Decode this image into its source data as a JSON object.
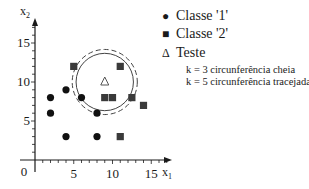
{
  "chart_data": {
    "type": "scatter",
    "title": "",
    "xlabel": "x1",
    "ylabel": "x2",
    "x_ticks": [
      0,
      5,
      10,
      15
    ],
    "y_ticks": [
      5,
      10,
      15
    ],
    "origin_label": "0",
    "xlim": [
      0,
      17
    ],
    "ylim": [
      0,
      17
    ],
    "grid": false,
    "legend_position": "upper right (outside plot)",
    "series": [
      {
        "name": "Classe '1'",
        "marker": "circle",
        "color": "#111111",
        "points": [
          [
            2,
            8
          ],
          [
            2,
            6
          ],
          [
            4,
            9
          ],
          [
            6,
            8
          ],
          [
            8,
            6
          ],
          [
            4,
            3
          ],
          [
            8,
            3
          ]
        ]
      },
      {
        "name": "Classe '2'",
        "marker": "square",
        "color": "#3a3a3a",
        "points": [
          [
            5,
            12
          ],
          [
            11,
            12
          ],
          [
            9,
            8
          ],
          [
            10,
            8
          ],
          [
            12.5,
            8
          ],
          [
            14,
            7
          ],
          [
            11,
            3
          ]
        ]
      },
      {
        "name": "Teste",
        "marker": "triangle-open",
        "color": "#555555",
        "points": [
          [
            9,
            10
          ]
        ]
      }
    ],
    "annotations": [
      {
        "type": "circle",
        "center": [
          9,
          10
        ],
        "radius": 3.7,
        "style": "solid",
        "label": "k = 3 circunferência cheia"
      },
      {
        "type": "circle",
        "center": [
          9,
          10
        ],
        "radius": 4.2,
        "style": "dashed",
        "label": "k = 5 circunferência tracejada"
      }
    ]
  },
  "legend": {
    "class1": {
      "symbol": "●",
      "label": "Classe '1'"
    },
    "class2": {
      "symbol": "■",
      "label": "Classe '2'"
    },
    "test": {
      "symbol": "Δ",
      "label": "Teste"
    },
    "note_k3": "k = 3 circunferência cheia",
    "note_k5": "k = 5 circunferência tracejada"
  },
  "axes": {
    "x_label_main": "x",
    "x_label_sub": "1",
    "y_label_main": "x",
    "y_label_sub": "2"
  }
}
